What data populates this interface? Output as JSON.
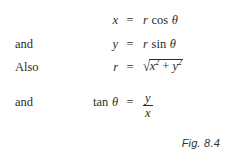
{
  "figure": {
    "caption": "Fig. 8.4",
    "equations": [
      {
        "lead": "",
        "lhs": "x",
        "relation": "=",
        "rhs_function": "cos",
        "rhs_coefficient": "r",
        "rhs_angle": "θ",
        "rhs_text": "r cos θ"
      },
      {
        "lead": "and",
        "lhs": "y",
        "relation": "=",
        "rhs_function": "sin",
        "rhs_coefficient": "r",
        "rhs_angle": "θ",
        "rhs_text": "r sin θ"
      },
      {
        "lead": "Also",
        "lhs": "r",
        "relation": "=",
        "radical_sign": "√",
        "radicand_first_base": "x",
        "radicand_first_exponent": "2",
        "radicand_operator": "+",
        "radicand_second_base": "y",
        "radicand_second_exponent": "2",
        "rhs_text": "√(x² + y²)"
      },
      {
        "lead": "and",
        "lhs_function": "tan",
        "lhs_angle": "θ",
        "relation": "=",
        "fraction_numerator": "y",
        "fraction_denominator": "x",
        "rhs_text": "y/x"
      }
    ]
  },
  "colors": {
    "background": "#ffffff",
    "text": "#2b2b2b",
    "caption_text": "#333333"
  }
}
